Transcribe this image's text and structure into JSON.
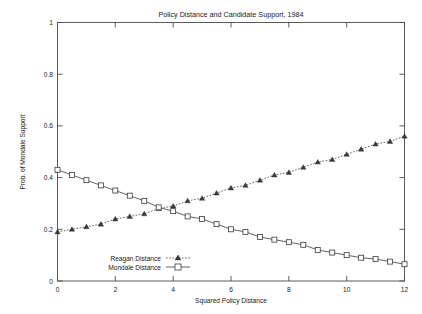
{
  "chart_data": {
    "type": "line",
    "title": "Policy Distance and Candidate Support, 1984",
    "xlabel": "Squared Policy Distance",
    "ylabel": "Prob. of Mondale Support",
    "xlim": [
      0,
      12
    ],
    "ylim": [
      0,
      1
    ],
    "xticks": [
      "0",
      "2",
      "4",
      "6",
      "8",
      "10",
      "12"
    ],
    "xtick_values": [
      0,
      2,
      4,
      6,
      8,
      10,
      12
    ],
    "yticks": [
      "0",
      "0.2",
      "0.4",
      "0.6",
      "0.8",
      "1"
    ],
    "ytick_values": [
      0,
      0.2,
      0.4,
      0.6,
      0.8,
      1
    ],
    "grid": false,
    "legend_position": "bottom-left-inside",
    "x": [
      0,
      0.5,
      1,
      1.5,
      2,
      2.5,
      3,
      3.5,
      4,
      4.5,
      5,
      5.5,
      6,
      6.5,
      7,
      7.5,
      8,
      8.5,
      9,
      9.5,
      10,
      10.5,
      11,
      11.5,
      12
    ],
    "series": [
      {
        "name": "Reagan Distance",
        "marker": "filled-triangle",
        "linestyle": "dotted",
        "color": "#3a3a3a",
        "values": [
          0.19,
          0.2,
          0.21,
          0.22,
          0.24,
          0.25,
          0.26,
          0.28,
          0.29,
          0.31,
          0.32,
          0.34,
          0.36,
          0.37,
          0.39,
          0.41,
          0.42,
          0.44,
          0.46,
          0.47,
          0.49,
          0.51,
          0.53,
          0.54,
          0.56
        ]
      },
      {
        "name": "Mondale Distance",
        "marker": "open-square",
        "linestyle": "solid",
        "color": "#3a3a3a",
        "values": [
          0.43,
          0.41,
          0.39,
          0.37,
          0.35,
          0.33,
          0.31,
          0.285,
          0.27,
          0.25,
          0.24,
          0.22,
          0.2,
          0.19,
          0.17,
          0.16,
          0.15,
          0.14,
          0.12,
          0.11,
          0.1,
          0.09,
          0.085,
          0.075,
          0.065
        ]
      }
    ],
    "annotations": {
      "crossing_note": "Curves cross near x = 3.7, y = 0.28"
    }
  },
  "legend": {
    "entries": [
      {
        "label": "Reagan Distance",
        "marker_icon": "filled-triangle-marker"
      },
      {
        "label": "Mondale Distance",
        "marker_icon": "open-square-marker"
      }
    ]
  },
  "colors": {
    "background": "#ffffff",
    "frame": "#4a4a4a",
    "ink": "#2a2a2a"
  }
}
